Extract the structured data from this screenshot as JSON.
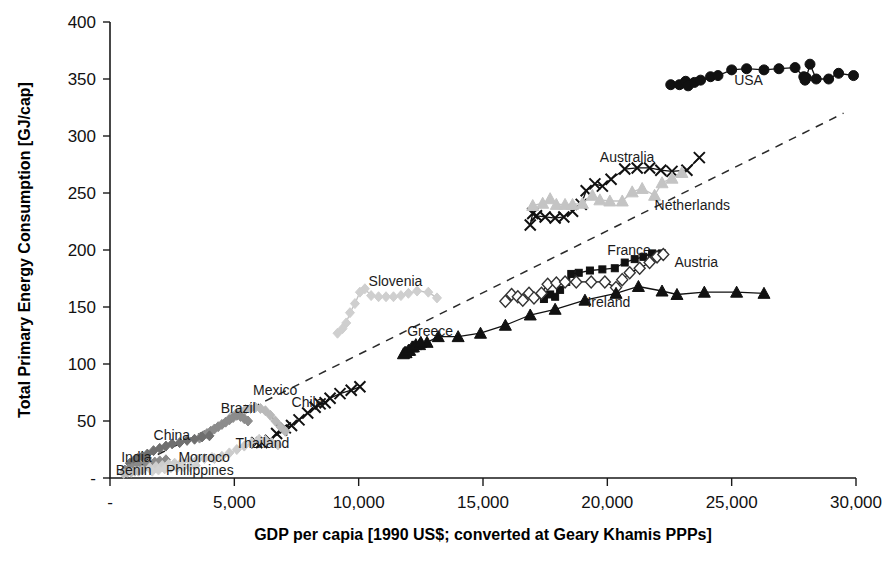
{
  "chart_data": {
    "type": "scatter",
    "title": "",
    "xlabel": "GDP per capia [1990 US$; converted at Geary Khamis PPPs]",
    "ylabel": "Total Primary Energy Consumption [GJ/cap]",
    "xlim": [
      0,
      30000
    ],
    "ylim": [
      0,
      400
    ],
    "xticks": [
      "-",
      "5,000",
      "10,000",
      "15,000",
      "20,000",
      "25,000",
      "30,000"
    ],
    "xtick_values": [
      0,
      5000,
      10000,
      15000,
      20000,
      25000,
      30000
    ],
    "yticks": [
      "-",
      "50",
      "100",
      "150",
      "200",
      "250",
      "300",
      "350",
      "400"
    ],
    "ytick_values": [
      0,
      50,
      100,
      150,
      200,
      250,
      300,
      350,
      400
    ],
    "grid": false,
    "legend_position": "inline-annotations",
    "trend_line": {
      "name": "reference trend",
      "style": "dashed",
      "x": [
        300,
        29500
      ],
      "y": [
        3,
        320
      ]
    },
    "series": [
      {
        "name": "USA",
        "marker": "filled-circle",
        "color": "#111111",
        "label_x": 25100,
        "label_y": 345,
        "points": [
          [
            22550,
            345
          ],
          [
            22900,
            345
          ],
          [
            23150,
            348
          ],
          [
            23250,
            344
          ],
          [
            23500,
            347
          ],
          [
            23750,
            349
          ],
          [
            24150,
            352
          ],
          [
            24450,
            353
          ],
          [
            25000,
            358
          ],
          [
            25600,
            359
          ],
          [
            26300,
            358
          ],
          [
            26900,
            359
          ],
          [
            27550,
            360
          ],
          [
            27900,
            352
          ],
          [
            27950,
            349
          ],
          [
            28000,
            351
          ],
          [
            28150,
            363
          ],
          [
            28400,
            350
          ],
          [
            28900,
            350
          ],
          [
            29300,
            355
          ],
          [
            29900,
            353
          ]
        ]
      },
      {
        "name": "Australia",
        "marker": "cross",
        "color": "#111111",
        "label_x": 19700,
        "label_y": 277,
        "points": [
          [
            16900,
            222
          ],
          [
            17000,
            232
          ],
          [
            17150,
            230
          ],
          [
            17500,
            229
          ],
          [
            17900,
            228
          ],
          [
            18250,
            229
          ],
          [
            18600,
            234
          ],
          [
            18950,
            240
          ],
          [
            19150,
            252
          ],
          [
            19500,
            258
          ],
          [
            19800,
            256
          ],
          [
            20150,
            262
          ],
          [
            20700,
            271
          ],
          [
            21200,
            272
          ],
          [
            21700,
            272
          ],
          [
            22150,
            270
          ],
          [
            22600,
            269
          ],
          [
            23200,
            270
          ],
          [
            23700,
            281
          ]
        ]
      },
      {
        "name": "Netherlands",
        "marker": "triangle",
        "color": "#c4c4c4",
        "label_x": 21900,
        "label_y": 235,
        "points": [
          [
            17000,
            239
          ],
          [
            17400,
            241
          ],
          [
            17700,
            245
          ],
          [
            17950,
            240
          ],
          [
            18300,
            240
          ],
          [
            18600,
            240
          ],
          [
            19000,
            241
          ],
          [
            19400,
            248
          ],
          [
            19700,
            244
          ],
          [
            20100,
            243
          ],
          [
            20600,
            243
          ],
          [
            21000,
            251
          ],
          [
            21400,
            254
          ],
          [
            21900,
            248
          ],
          [
            22200,
            259
          ],
          [
            22600,
            263
          ],
          [
            23000,
            268
          ]
        ]
      },
      {
        "name": "France",
        "marker": "filled-square",
        "color": "#111111",
        "label_x": 20000,
        "label_y": 196,
        "points": [
          [
            17450,
            157
          ],
          [
            17700,
            161
          ],
          [
            17900,
            159
          ],
          [
            18100,
            165
          ],
          [
            18350,
            172
          ],
          [
            18550,
            179
          ],
          [
            18850,
            180
          ],
          [
            19300,
            182
          ],
          [
            19800,
            183
          ],
          [
            20300,
            184
          ],
          [
            20700,
            189
          ],
          [
            21100,
            192
          ],
          [
            21450,
            194
          ],
          [
            21800,
            197
          ],
          [
            22200,
            197
          ]
        ]
      },
      {
        "name": "Austria",
        "marker": "open-diamond",
        "color": "#333333",
        "label_x": 22700,
        "label_y": 185,
        "points": [
          [
            15900,
            155
          ],
          [
            16150,
            161
          ],
          [
            16400,
            159
          ],
          [
            16600,
            156
          ],
          [
            16850,
            162
          ],
          [
            17050,
            158
          ],
          [
            17350,
            162
          ],
          [
            17600,
            170
          ],
          [
            17950,
            171
          ],
          [
            18300,
            172
          ],
          [
            18750,
            172
          ],
          [
            19350,
            172
          ],
          [
            19900,
            172
          ],
          [
            20350,
            167
          ],
          [
            20600,
            174
          ],
          [
            20900,
            180
          ],
          [
            21300,
            184
          ],
          [
            21700,
            189
          ],
          [
            22000,
            194
          ],
          [
            22250,
            196
          ]
        ]
      },
      {
        "name": "Ireland",
        "marker": "filled-triangle",
        "color": "#111111",
        "label_x": 19200,
        "label_y": 150,
        "points": [
          [
            11850,
            110
          ],
          [
            11900,
            110
          ],
          [
            12050,
            112
          ],
          [
            12200,
            115
          ],
          [
            12450,
            117
          ],
          [
            12750,
            119
          ],
          [
            13200,
            124
          ],
          [
            14000,
            124
          ],
          [
            14900,
            127
          ],
          [
            15900,
            134
          ],
          [
            16900,
            143
          ],
          [
            17900,
            148
          ],
          [
            19100,
            156
          ],
          [
            20350,
            162
          ],
          [
            21250,
            168
          ],
          [
            22200,
            164
          ],
          [
            22800,
            161
          ],
          [
            23900,
            163
          ],
          [
            25200,
            163
          ],
          [
            26300,
            162
          ]
        ]
      },
      {
        "name": "Greece",
        "marker": "filled-triangle",
        "color": "#111111",
        "label_x": 11950,
        "label_y": 125,
        "points": [
          [
            11800,
            109
          ],
          [
            11900,
            110
          ],
          [
            12000,
            112
          ],
          [
            12150,
            115
          ],
          [
            12300,
            117
          ],
          [
            12500,
            119
          ]
        ]
      },
      {
        "name": "Slovenia",
        "marker": "diamond",
        "color": "#cfcfcf",
        "label_x": 10400,
        "label_y": 168,
        "points": [
          [
            9150,
            127
          ],
          [
            9350,
            131
          ],
          [
            9500,
            136
          ],
          [
            9650,
            145
          ],
          [
            9850,
            153
          ],
          [
            10050,
            163
          ],
          [
            10250,
            166
          ],
          [
            10500,
            160
          ],
          [
            10800,
            159
          ],
          [
            11100,
            159
          ],
          [
            11400,
            159
          ],
          [
            11700,
            160
          ],
          [
            12000,
            162
          ],
          [
            12350,
            164
          ],
          [
            12800,
            163
          ],
          [
            13150,
            158
          ]
        ]
      },
      {
        "name": "Chile",
        "marker": "cross",
        "color": "#111111",
        "label_x": 7300,
        "label_y": 62
      },
      {
        "name": "Mexico",
        "marker": "diamond",
        "color": "#b9b9b9",
        "label_x": 5750,
        "label_y": 73
      },
      {
        "name": "Brazil",
        "marker": "filled-diamond",
        "color": "#8c8c8c",
        "label_x": 4450,
        "label_y": 57
      },
      {
        "name": "Thailand",
        "marker": "diamond",
        "color": "#cccccc",
        "label_x": 5050,
        "label_y": 26
      },
      {
        "name": "China",
        "marker": "filled-diamond",
        "color": "#6f6f6f",
        "label_x": 1750,
        "label_y": 33
      },
      {
        "name": "India",
        "marker": "filled-diamond",
        "color": "#8a8a8a",
        "label_x": 450,
        "label_y": 14
      },
      {
        "name": "Benin",
        "marker": "diamond",
        "color": "#bdbdbd",
        "label_x": 230,
        "label_y": 3
      },
      {
        "name": "Morroco",
        "marker": "diamond",
        "color": "#cdcdcd",
        "label_x": 2750,
        "label_y": 14
      },
      {
        "name": "Philippines",
        "marker": "diamond",
        "color": "#d2d2d2",
        "label_x": 2250,
        "label_y": 3
      }
    ],
    "annotations": [
      "USA",
      "Australia",
      "Netherlands",
      "France",
      "Austria",
      "Ireland",
      "Greece",
      "Slovenia",
      "Chile",
      "Mexico",
      "Brazil",
      "Thailand",
      "China",
      "India",
      "Benin",
      "Morroco",
      "Philippines"
    ]
  },
  "geometry": {
    "plot_left": 110,
    "plot_right": 856,
    "plot_top": 22,
    "plot_bottom": 478
  },
  "extra_series_points": {
    "Chile": [
      [
        5900,
        31
      ],
      [
        6100,
        31
      ],
      [
        6450,
        33
      ],
      [
        6700,
        39
      ],
      [
        6900,
        42
      ],
      [
        7050,
        44
      ],
      [
        7300,
        46
      ],
      [
        7600,
        51
      ],
      [
        7950,
        57
      ],
      [
        8250,
        62
      ],
      [
        8450,
        65
      ],
      [
        8650,
        66
      ],
      [
        8850,
        70
      ],
      [
        9250,
        74
      ],
      [
        9700,
        77
      ],
      [
        10050,
        80
      ]
    ],
    "Mexico": [
      [
        4850,
        53
      ],
      [
        5050,
        56
      ],
      [
        5250,
        58
      ],
      [
        5450,
        60
      ],
      [
        5650,
        61
      ],
      [
        5850,
        62
      ],
      [
        6050,
        61
      ],
      [
        6250,
        59
      ],
      [
        6450,
        55
      ],
      [
        6650,
        50
      ],
      [
        6850,
        45
      ],
      [
        7050,
        41
      ]
    ],
    "Brazil": [
      [
        3600,
        35
      ],
      [
        3750,
        37
      ],
      [
        3900,
        39
      ],
      [
        4050,
        41
      ],
      [
        4200,
        43
      ],
      [
        4350,
        45
      ],
      [
        4500,
        47
      ],
      [
        4650,
        49
      ],
      [
        4800,
        51
      ],
      [
        4950,
        53
      ],
      [
        5100,
        55
      ],
      [
        5250,
        54
      ],
      [
        5400,
        52
      ],
      [
        5550,
        50
      ]
    ],
    "Thailand": [
      [
        4200,
        17
      ],
      [
        4500,
        19
      ],
      [
        4800,
        22
      ],
      [
        5100,
        25
      ],
      [
        5400,
        28
      ],
      [
        5700,
        31
      ],
      [
        6000,
        34
      ],
      [
        6250,
        33
      ],
      [
        6500,
        31
      ],
      [
        6750,
        29
      ]
    ],
    "China": [
      [
        800,
        13
      ],
      [
        950,
        15
      ],
      [
        1100,
        17
      ],
      [
        1300,
        19
      ],
      [
        1500,
        21
      ],
      [
        1750,
        24
      ],
      [
        2000,
        26
      ],
      [
        2250,
        28
      ],
      [
        2500,
        30
      ],
      [
        2800,
        31
      ],
      [
        3100,
        33
      ],
      [
        3400,
        34
      ],
      [
        3700,
        36
      ],
      [
        4000,
        37
      ]
    ],
    "India": [
      [
        600,
        7
      ],
      [
        750,
        8
      ],
      [
        900,
        9
      ],
      [
        1050,
        10
      ],
      [
        1200,
        11
      ],
      [
        1400,
        12
      ],
      [
        1600,
        13
      ],
      [
        1800,
        14
      ],
      [
        2000,
        15
      ],
      [
        2250,
        16
      ]
    ],
    "Benin": [
      [
        550,
        4
      ],
      [
        700,
        5
      ],
      [
        850,
        5
      ],
      [
        1000,
        6
      ],
      [
        1150,
        6
      ],
      [
        1300,
        7
      ]
    ],
    "Morroco": [
      [
        1600,
        9
      ],
      [
        1850,
        10
      ],
      [
        2100,
        11
      ],
      [
        2350,
        12
      ],
      [
        2600,
        13
      ],
      [
        2900,
        14
      ],
      [
        3200,
        15
      ],
      [
        3500,
        16
      ],
      [
        3800,
        17
      ],
      [
        4100,
        18
      ]
    ],
    "Philippines": [
      [
        1700,
        6
      ],
      [
        1950,
        7
      ],
      [
        2200,
        8
      ],
      [
        2450,
        9
      ],
      [
        2700,
        9
      ],
      [
        2950,
        10
      ],
      [
        3200,
        10
      ],
      [
        3450,
        11
      ]
    ]
  }
}
